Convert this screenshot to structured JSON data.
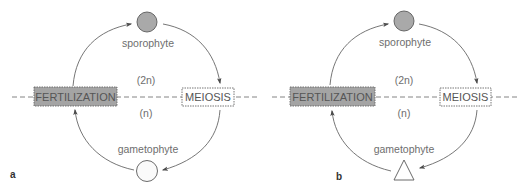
{
  "panels": [
    {
      "letter": "a",
      "sporophyte_label": "sporophyte",
      "gametophyte_label": "gametophyte",
      "diploid_label": "(2n)",
      "haploid_label": "(n)",
      "fertilization_label": "FERTILIZATION",
      "meiosis_label": "MEIOSIS",
      "sporophyte_shape": "circle-filled",
      "gametophyte_shape": "circle-open"
    },
    {
      "letter": "b",
      "sporophyte_label": "sporophyte",
      "gametophyte_label": "gametophyte",
      "diploid_label": "(2n)",
      "haploid_label": "(n)",
      "fertilization_label": "FERTILIZATION",
      "meiosis_label": "MEIOSIS",
      "sporophyte_shape": "circle-filled",
      "gametophyte_shape": "triangle-open"
    }
  ],
  "colors": {
    "sporophyte_fill": "#a9a9a9",
    "fertilization_fill": "#a4a4a4",
    "stroke": "#5a5a5a",
    "text": "#6e6e6e"
  }
}
